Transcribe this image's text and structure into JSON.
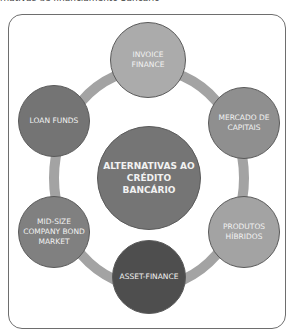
{
  "caption": "rnativas de financiamento bancário",
  "diagram": {
    "center": {
      "label": "ALTERNATIVAS AO CRÉDITO BANCÁRIO",
      "color": "#757575"
    },
    "ring_color": "#a3a3a3",
    "nodes": [
      {
        "label": "INVOICE FINANCE",
        "color": "#ababab"
      },
      {
        "label": "MERCADO DE CAPITAIS",
        "color": "#8f8f8f"
      },
      {
        "label": "PRODUTOS HÍBRIDOS",
        "color": "#a3a3a3"
      },
      {
        "label": "ASSET-FINANCE",
        "color": "#4e4e4e"
      },
      {
        "label": "MID-SIZE COMPANY BOND MARKET",
        "color": "#808080"
      },
      {
        "label": "LOAN FUNDS",
        "color": "#747474"
      }
    ]
  }
}
